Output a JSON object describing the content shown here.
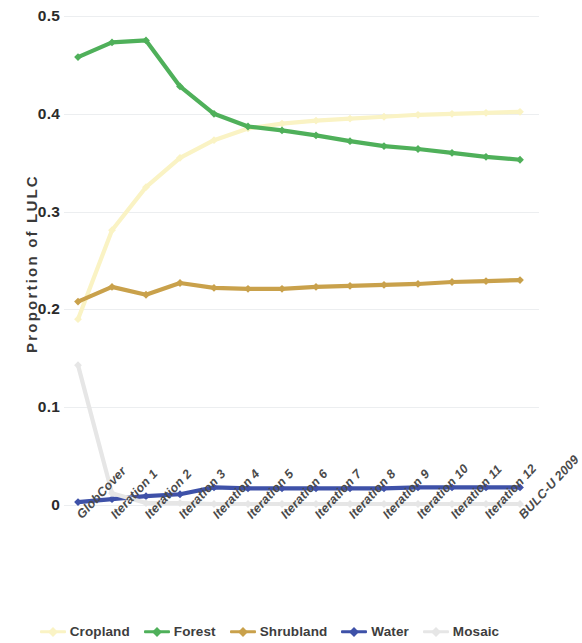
{
  "chart_data": {
    "type": "line",
    "title": "",
    "xlabel": "",
    "ylabel": "Proportion of LULC",
    "ylim": [
      0,
      0.5
    ],
    "yticks": [
      "0",
      "0.1",
      "0.2",
      "0.3",
      "0.4",
      "0.5"
    ],
    "ytick_values": [
      0,
      0.1,
      0.2,
      0.3,
      0.4,
      0.5
    ],
    "grid": true,
    "legend_position": "bottom",
    "categories": [
      "GlobCover",
      "Iteration 1",
      "Iteration 2",
      "Iteration 3",
      "Iteration 4",
      "Iteration 5",
      "Iteration 6",
      "Iteration 7",
      "Iteration 8",
      "Iteration 9",
      "Iteration 10",
      "Iteration 11",
      "Iteration 12",
      "BULC-U 2009"
    ],
    "series": [
      {
        "name": "Cropland",
        "color": "#FAF3C4",
        "values": [
          0.19,
          0.281,
          0.325,
          0.355,
          0.373,
          0.385,
          0.39,
          0.393,
          0.395,
          0.397,
          0.399,
          0.4,
          0.401,
          0.402
        ]
      },
      {
        "name": "Forest",
        "color": "#4FB05A",
        "values": [
          0.458,
          0.473,
          0.475,
          0.428,
          0.4,
          0.387,
          0.383,
          0.378,
          0.372,
          0.367,
          0.364,
          0.36,
          0.356,
          0.353
        ]
      },
      {
        "name": "Shrubland",
        "color": "#C9A14B",
        "values": [
          0.208,
          0.223,
          0.215,
          0.227,
          0.222,
          0.221,
          0.221,
          0.223,
          0.224,
          0.225,
          0.226,
          0.228,
          0.229,
          0.23
        ]
      },
      {
        "name": "Water",
        "color": "#3E51A8",
        "values": [
          0.003,
          0.006,
          0.009,
          0.011,
          0.018,
          0.017,
          0.017,
          0.017,
          0.017,
          0.017,
          0.018,
          0.018,
          0.018,
          0.018
        ]
      },
      {
        "name": "Mosaic",
        "color": "#E6E6E6",
        "values": [
          0.143,
          0.012,
          0.002,
          0.002,
          0.001,
          0.001,
          0.001,
          0.001,
          0.001,
          0.001,
          0.001,
          0.001,
          0.001,
          0.001
        ]
      }
    ]
  },
  "legend": {
    "items": [
      {
        "label": "Cropland"
      },
      {
        "label": "Forest"
      },
      {
        "label": "Shrubland"
      },
      {
        "label": "Water"
      },
      {
        "label": "Mosaic"
      }
    ]
  }
}
